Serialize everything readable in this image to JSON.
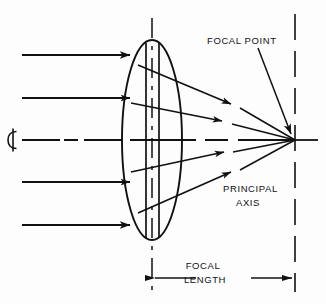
{
  "diagram": {
    "background_color": "#fdfdfd",
    "line_color": "#111111",
    "labels": {
      "focal_point": "FOCAL POINT",
      "principal_axis_line1": "PRINCIPAL",
      "principal_axis_line2": "AXIS",
      "focal_length_line1": "FOCAL",
      "focal_length_line2": "LENGTH",
      "centerline_symbol": "℄"
    },
    "geometry": {
      "lens": {
        "center_x": 152,
        "center_y": 140,
        "radius_x": 30,
        "radius_y": 100
      },
      "focal_point": {
        "x": 295,
        "y": 140
      },
      "optical_axis_y": 140,
      "lens_centerline_x": 152,
      "focal_plane_x": 295,
      "lens_body_lines_x": [
        146,
        159
      ],
      "incoming_ray_y": [
        55,
        98,
        182,
        225
      ],
      "incoming_ray_start_x": 22,
      "incoming_ray_end_x": 130,
      "focal_length_dimension": {
        "y": 278,
        "from_x": 152,
        "to_x": 295
      }
    },
    "refracted_rays": [
      {
        "from_x": 138,
        "from_y": 65,
        "arrow_x": 231,
        "arrow_y": 104
      },
      {
        "from_x": 131,
        "from_y": 103,
        "arrow_x": 222,
        "arrow_y": 121
      },
      {
        "from_x": 131,
        "from_y": 172,
        "arrow_x": 224,
        "arrow_y": 152
      },
      {
        "from_x": 138,
        "from_y": 213,
        "arrow_x": 231,
        "arrow_y": 172
      }
    ]
  }
}
